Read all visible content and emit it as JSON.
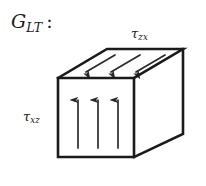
{
  "figure": {
    "name": "shear-modulus-block-diagram",
    "background_color": "#ffffff",
    "line_color": "#1a1a1a",
    "modulus_label": {
      "base": "G",
      "subscript": "LT",
      "colon": ":"
    },
    "labels": {
      "top_face": {
        "base": "τ",
        "subscript": "zx"
      },
      "front_face": {
        "base": "τ",
        "subscript": "xz"
      }
    },
    "block": {
      "type": "oblique-projection-cuboid",
      "front_face": {
        "left": 58,
        "top": 78,
        "right": 134,
        "bottom": 157
      },
      "depth_offset": {
        "dx": 49,
        "dy": -29
      }
    },
    "arrows": {
      "top_face": {
        "count": 3,
        "direction": "down-left",
        "meaning": "shear stress tau-zx"
      },
      "front_face": {
        "count": 3,
        "direction": "up",
        "meaning": "shear stress tau-xz"
      }
    }
  }
}
